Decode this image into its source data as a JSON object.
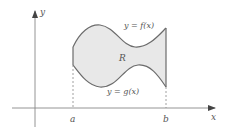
{
  "diagram": {
    "axes": {
      "x_label": "x",
      "y_label": "y"
    },
    "region_label": "R",
    "upper_curve_label": "y = f(x)",
    "lower_curve_label": "y = g(x)",
    "x_ticks": [
      "a",
      "b"
    ],
    "colors": {
      "region_fill": "#e8e8e8",
      "curve_stroke": "#6b6b6b",
      "axis_stroke": "#888888",
      "label_text": "#555555"
    }
  }
}
